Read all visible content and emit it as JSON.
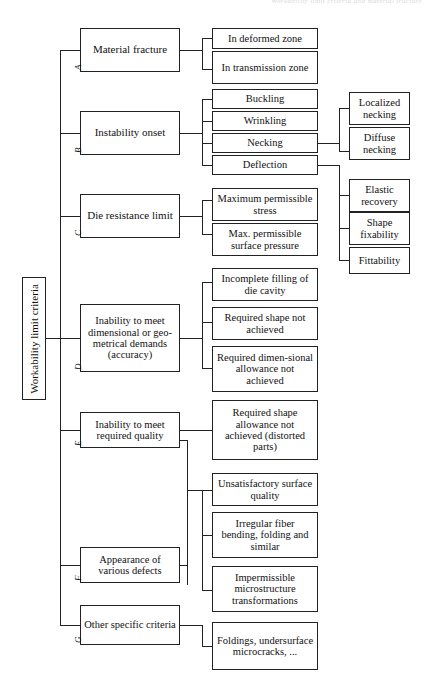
{
  "page": {
    "header_fragment": "Workability limit criteria and material fracture"
  },
  "diagram": {
    "type": "tree",
    "root": {
      "label": "Workability limit criteria"
    },
    "branches": [
      {
        "tag": "A",
        "label": "Material fracture",
        "children": [
          {
            "label": "In deformed zone"
          },
          {
            "label": "In transmission zone"
          }
        ]
      },
      {
        "tag": "B",
        "label": "Instability onset",
        "children": [
          {
            "label": "Buckling"
          },
          {
            "label": "Wrinkling"
          },
          {
            "label": "Necking",
            "children": [
              {
                "label": "Localized necking"
              },
              {
                "label": "Diffuse necking"
              }
            ]
          },
          {
            "label": "Deflection",
            "children": [
              {
                "label": "Elastic recovery"
              },
              {
                "label": "Shape fixability"
              },
              {
                "label": "Fittability"
              }
            ]
          }
        ]
      },
      {
        "tag": "C",
        "label": "Die resistance limit",
        "children": [
          {
            "label": "Maximum permissible stress"
          },
          {
            "label": "Max. permissible surface pressure"
          }
        ]
      },
      {
        "tag": "D",
        "label": "Inability to meet dimensional or geo-metrical demands (accuracy)",
        "children": [
          {
            "label": "Incomplete filling of die cavity"
          },
          {
            "label": "Required shape not achieved"
          },
          {
            "label": "Required dimen-sional allowance not achieved"
          }
        ]
      },
      {
        "tag": "E",
        "label": "Inability to meet required quality",
        "children": [
          {
            "label": "Required shape allowance not achieved (distorted parts)"
          }
        ]
      },
      {
        "tag": "F",
        "label": "Appearance of various defects",
        "children": [
          {
            "label": "Unsatisfactory surface quality"
          },
          {
            "label": "Irregular fiber bending, folding and similar"
          },
          {
            "label": "Impermissible microstructure transformations"
          }
        ]
      },
      {
        "tag": "G",
        "label": "Other specific criteria",
        "children": [
          {
            "label": "Foldings, undersurface microcracks, ..."
          }
        ]
      }
    ],
    "boxes": {
      "root": "Workability limit criteria",
      "a": "Material fracture",
      "b": "Instability onset",
      "c": "Die resistance limit",
      "d": "Inability to meet dimensional or geo-metrical demands (accuracy)",
      "e": "Inability to meet required quality",
      "f": "Appearance of various defects",
      "g": "Other specific criteria",
      "a1": "In deformed zone",
      "a2": "In transmission zone",
      "b1": "Buckling",
      "b2": "Wrinkling",
      "b3": "Necking",
      "b4": "Deflection",
      "c1": "Maximum permissible stress",
      "c2": "Max. permissible surface pressure",
      "d1": "Incomplete filling of die cavity",
      "d2": "Required shape not achieved",
      "d3": "Required dimen-sional allowance not achieved",
      "e1": "Required shape allowance not achieved (distorted parts)",
      "f1": "Unsatisfactory surface quality",
      "f2": "Irregular fiber bending, folding and similar",
      "f3": "Impermissible microstructure transformations",
      "g1": "Foldings, undersurface microcracks, ...",
      "n1": "Localized necking",
      "n2": "Diffuse necking",
      "n3": "Elastic recovery",
      "n4": "Shape fixability",
      "n5": "Fittability"
    },
    "tags": {
      "a": "A",
      "b": "B",
      "c": "C",
      "d": "D",
      "e": "E",
      "f": "F",
      "g": "G"
    }
  }
}
